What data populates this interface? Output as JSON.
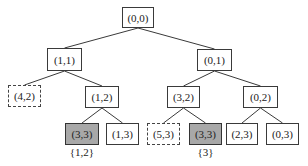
{
  "diagram": {
    "type": "tree",
    "nodes": [
      {
        "id": "n0",
        "label": "(0,0)",
        "style": "normal",
        "x": 122,
        "y": 7,
        "w": 32,
        "h": 21
      },
      {
        "id": "n1",
        "label": "(1,1)",
        "style": "normal",
        "x": 47,
        "y": 48,
        "w": 35,
        "h": 23
      },
      {
        "id": "n2",
        "label": "(0,1)",
        "style": "normal",
        "x": 197,
        "y": 49,
        "w": 35,
        "h": 22
      },
      {
        "id": "n3",
        "label": "(4,2)",
        "style": "dashed",
        "x": 8,
        "y": 85,
        "w": 33,
        "h": 22
      },
      {
        "id": "n4",
        "label": "(1,2)",
        "style": "normal",
        "x": 85,
        "y": 86,
        "w": 34,
        "h": 22
      },
      {
        "id": "n5",
        "label": "(3,2)",
        "style": "normal",
        "x": 167,
        "y": 86,
        "w": 33,
        "h": 22
      },
      {
        "id": "n6",
        "label": "(0,2)",
        "style": "normal",
        "x": 243,
        "y": 86,
        "w": 35,
        "h": 22
      },
      {
        "id": "n7",
        "label": "(3,3)",
        "style": "goal",
        "x": 65,
        "y": 123,
        "w": 34,
        "h": 22,
        "annotation": "{1,2}"
      },
      {
        "id": "n8",
        "label": "(1,3)",
        "style": "normal",
        "x": 106,
        "y": 123,
        "w": 33,
        "h": 22
      },
      {
        "id": "n9",
        "label": "(5,3)",
        "style": "dashed",
        "x": 147,
        "y": 123,
        "w": 33,
        "h": 22
      },
      {
        "id": "n10",
        "label": "(3,3)",
        "style": "goal",
        "x": 189,
        "y": 123,
        "w": 33,
        "h": 22,
        "annotation": "{3}"
      },
      {
        "id": "n11",
        "label": "(2,3)",
        "style": "normal",
        "x": 226,
        "y": 123,
        "w": 32,
        "h": 22
      },
      {
        "id": "n12",
        "label": "(0,3)",
        "style": "normal",
        "x": 266,
        "y": 123,
        "w": 33,
        "h": 22
      }
    ],
    "edges": [
      [
        "n0",
        "n1"
      ],
      [
        "n0",
        "n2"
      ],
      [
        "n1",
        "n3"
      ],
      [
        "n1",
        "n4"
      ],
      [
        "n2",
        "n5"
      ],
      [
        "n2",
        "n6"
      ],
      [
        "n4",
        "n7"
      ],
      [
        "n4",
        "n8"
      ],
      [
        "n5",
        "n9"
      ],
      [
        "n5",
        "n10"
      ],
      [
        "n6",
        "n11"
      ],
      [
        "n6",
        "n12"
      ]
    ],
    "colors": {
      "goal_fill": "#a8a8a8",
      "line": "#3a3a3a",
      "background": "#ffffff"
    }
  }
}
